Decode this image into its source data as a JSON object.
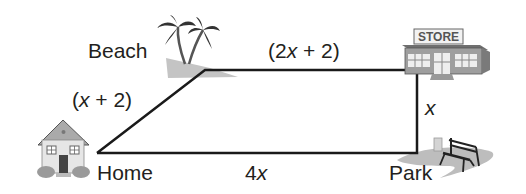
{
  "diagram": {
    "type": "quadrilateral route map",
    "locations": {
      "home": "Home",
      "beach": "Beach",
      "store": "STORE",
      "park": "Park"
    },
    "sides": {
      "home_beach": {
        "open": "(",
        "var": "x",
        "rest": " + 2)"
      },
      "beach_store": {
        "open": "(2",
        "var": "x",
        "rest": " + 2)"
      },
      "store_park": {
        "var": "x"
      },
      "park_home": {
        "coef": "4",
        "var": "x"
      }
    },
    "colors": {
      "line": "#1a1a1a",
      "text": "#231f20",
      "shadow_gray": "#bdbdbd",
      "icon_gray": "#8c8c8c"
    }
  }
}
